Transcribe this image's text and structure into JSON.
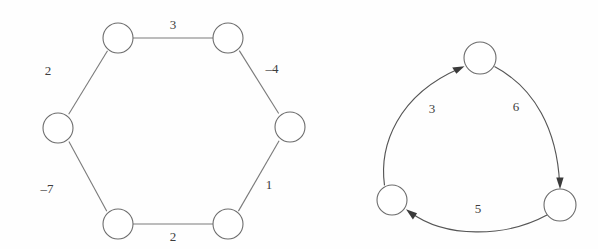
{
  "figure": {
    "background_color": "#fefefe",
    "stroke_color": "#6d6d6d",
    "label_color": "#3d3d3d",
    "arrow_color": "#3a3a3a"
  },
  "graphs": [
    {
      "id": "hexagon-graph",
      "type": "undirected-cycle",
      "node_count": 6,
      "nodes": [
        {
          "id": "h1",
          "cx": 118,
          "cy": 38,
          "r": 15
        },
        {
          "id": "h2",
          "cx": 228,
          "cy": 38,
          "r": 15
        },
        {
          "id": "h3",
          "cx": 290,
          "cy": 127,
          "r": 15
        },
        {
          "id": "h4",
          "cx": 228,
          "cy": 224,
          "r": 15
        },
        {
          "id": "h5",
          "cx": 118,
          "cy": 224,
          "r": 15
        },
        {
          "id": "h6",
          "cx": 58,
          "cy": 128,
          "r": 15
        }
      ],
      "edges": [
        {
          "id": "h1-h2",
          "from": "h1",
          "to": "h2",
          "label": "3",
          "lx": 173,
          "ly": 26
        },
        {
          "id": "h2-h3",
          "from": "h2",
          "to": "h3",
          "label": "–4",
          "lx": 272,
          "ly": 70
        },
        {
          "id": "h3-h4",
          "from": "h3",
          "to": "h4",
          "label": "1",
          "lx": 269,
          "ly": 186
        },
        {
          "id": "h4-h5",
          "from": "h4",
          "to": "h5",
          "label": "2",
          "lx": 173,
          "ly": 238
        },
        {
          "id": "h5-h6",
          "from": "h5",
          "to": "h6",
          "label": "–7",
          "lx": 47,
          "ly": 190
        },
        {
          "id": "h6-h1",
          "from": "h6",
          "to": "h1",
          "label": "2",
          "lx": 48,
          "ly": 72
        }
      ]
    },
    {
      "id": "triangle-graph",
      "type": "directed-cycle",
      "node_count": 3,
      "nodes": [
        {
          "id": "t1",
          "cx": 480,
          "cy": 58,
          "r": 16
        },
        {
          "id": "t2",
          "cx": 560,
          "cy": 205,
          "r": 16
        },
        {
          "id": "t3",
          "cx": 392,
          "cy": 200,
          "r": 15
        }
      ],
      "edges": [
        {
          "id": "t3-t1",
          "from": "t3",
          "to": "t1",
          "label": "3",
          "lx": 432,
          "ly": 110,
          "directed": true
        },
        {
          "id": "t1-t2",
          "from": "t1",
          "to": "t2",
          "label": "6",
          "lx": 516,
          "ly": 108,
          "directed": true
        },
        {
          "id": "t2-t3",
          "from": "t2",
          "to": "t3",
          "label": "5",
          "lx": 478,
          "ly": 210,
          "directed": true
        }
      ]
    }
  ]
}
